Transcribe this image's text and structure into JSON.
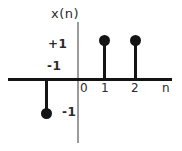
{
  "figure": {
    "signal_label": "x(n)",
    "amplitude_labels": {
      "positive": "+1",
      "negative_axis": "-1",
      "negative_amplitude": "-1"
    },
    "axis_ticks": {
      "t0": "0",
      "t1": "1",
      "t2": "2",
      "axis_name": "n"
    },
    "colors": {
      "stem": "#141414",
      "axis_horizontal": "#141414",
      "axis_vertical": "#9b9b9b",
      "text": "#2b2b2b",
      "background": "#ffffff"
    }
  },
  "chart_data": {
    "type": "scatter",
    "plot_style": "stem",
    "title": "",
    "subtitle": "",
    "xlabel": "n",
    "ylabel": "x(n)",
    "x": [
      -1,
      0,
      1,
      2
    ],
    "values": [
      -1,
      0,
      1,
      1
    ],
    "series": [
      {
        "name": "x(n)",
        "points": [
          {
            "n": -1,
            "value": -1
          },
          {
            "n": 0,
            "value": 0
          },
          {
            "n": 1,
            "value": 1
          },
          {
            "n": 2,
            "value": 1
          }
        ]
      }
    ],
    "xlim": [
      -2.2,
      3.3
    ],
    "ylim": [
      -1.6,
      1.6
    ],
    "xticks": [
      0,
      1,
      2
    ],
    "xticklabels": [
      "0",
      "1",
      "2"
    ],
    "yticks": [
      -1,
      1
    ],
    "yticklabels": [
      "-1",
      "+1"
    ],
    "annotations": [
      {
        "text": "-1",
        "role": "x-tick-label-negative-one",
        "n": -1
      },
      {
        "text": "-1",
        "role": "amplitude-label-negative-one",
        "value": -1
      },
      {
        "text": "+1",
        "role": "amplitude-label-positive-one",
        "value": 1
      },
      {
        "text": "x(n)",
        "role": "vertical-axis-label"
      },
      {
        "text": "n",
        "role": "horizontal-axis-label"
      }
    ],
    "grid": false,
    "legend": false,
    "legend_position": "none"
  }
}
